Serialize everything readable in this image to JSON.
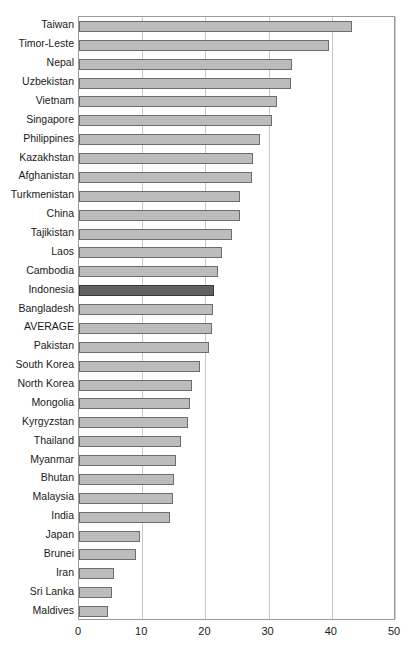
{
  "chart_data": {
    "type": "bar",
    "orientation": "horizontal",
    "title": "",
    "xlabel": "",
    "ylabel": "",
    "xlim": [
      0,
      50
    ],
    "xticks": [
      0,
      10,
      20,
      30,
      40,
      50
    ],
    "grid": true,
    "legend": "none",
    "highlight_category": "Indonesia",
    "colors": {
      "bar_fill": "#bcbcbc",
      "bar_border": "#6d6d6d",
      "highlight_fill": "#606060",
      "highlight_border": "#3a3a3a",
      "gridline": "#c8c8c8",
      "axis": "#9a9a9a",
      "text": "#1a1a1a"
    },
    "categories": [
      "Taiwan",
      "Timor-Leste",
      "Nepal",
      "Uzbekistan",
      "Vietnam",
      "Singapore",
      "Philippines",
      "Kazakhstan",
      "Afghanistan",
      "Turkmenistan",
      "China",
      "Tajikistan",
      "Laos",
      "Cambodia",
      "Indonesia",
      "Bangladesh",
      "AVERAGE",
      "Pakistan",
      "South Korea",
      "North Korea",
      "Mongolia",
      "Kyrgyzstan",
      "Thailand",
      "Myanmar",
      "Bhutan",
      "Malaysia",
      "India",
      "Japan",
      "Brunei",
      "Iran",
      "Sri Lanka",
      "Maldives"
    ],
    "values": [
      43.2,
      39.5,
      33.7,
      33.6,
      31.3,
      30.5,
      28.6,
      27.5,
      27.4,
      25.5,
      25.4,
      24.2,
      22.6,
      22.0,
      21.3,
      21.2,
      21.1,
      20.5,
      19.2,
      17.9,
      17.5,
      17.3,
      16.1,
      15.4,
      15.0,
      14.9,
      14.4,
      9.7,
      9.0,
      5.6,
      5.3,
      4.6
    ]
  }
}
